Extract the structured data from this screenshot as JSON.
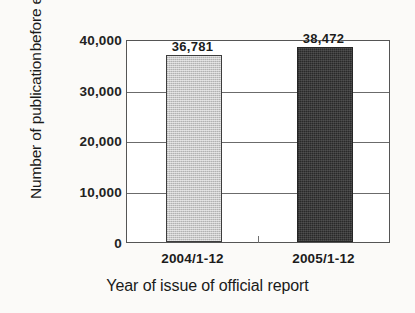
{
  "chart_data": {
    "type": "bar",
    "title": "",
    "subtitle": "",
    "xlabel": "Year of issue of official report",
    "ylabel_lines": [
      "Number of publication",
      "before examination"
    ],
    "ylabel": "Number of publication before examination",
    "categories": [
      "2004/1-12",
      "2005/1-12"
    ],
    "values": [
      36781,
      38472
    ],
    "value_labels": [
      "36,781",
      "38,472"
    ],
    "bar_colors": [
      "#c9c9c9",
      "#3b3b3b"
    ],
    "ylim": [
      0,
      40000
    ],
    "ytick_values": [
      0,
      10000,
      20000,
      30000,
      40000
    ],
    "ytick_labels": [
      "0",
      "10,000",
      "20,000",
      "30,000",
      "40,000"
    ],
    "grid": true,
    "grid_axis": "y",
    "legend": false,
    "legend_position": "none",
    "background_color": "#fbfaf8",
    "plot_background_color": "#ffffff",
    "axis_color": "#555555"
  }
}
